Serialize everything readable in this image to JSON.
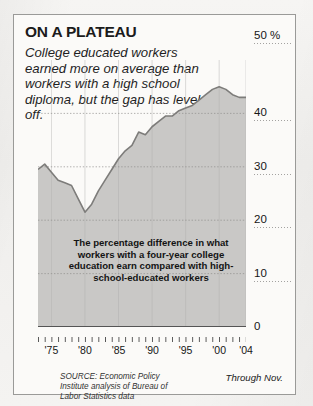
{
  "title": "ON A PLATEAU",
  "subtitle": "College educated workers earned more on average than workers with a high school diploma, but the gap has leveled off.",
  "annotation": "The percentage difference in what workers with a four-year college education earn compared with high-school-educated workers",
  "source": "SOURCE: Economic Policy Institute analysis of Bureau of Labor Statistics data",
  "through_note": "Through Nov.",
  "colors": {
    "area_fill": "#c9c8c6",
    "line": "#7d7c7a",
    "frame": "#9a9a98",
    "text": "#1b1b1b",
    "gridline": "#8d8c8a"
  },
  "chart_data": {
    "type": "area",
    "title": "ON A PLATEAU",
    "subtitle": "College educated workers earned more on average than workers with a high school diploma, but the gap has leveled off.",
    "xlabel": "",
    "ylabel": "",
    "ylim": [
      0,
      50
    ],
    "xlim": [
      1973,
      2004
    ],
    "grid": true,
    "y_unit": "%",
    "y_ticks": [
      0,
      10,
      20,
      30,
      40,
      50
    ],
    "y_tick_labels": [
      "0",
      "10",
      "20",
      "30",
      "40",
      "50 %"
    ],
    "x_ticks": [
      1975,
      1980,
      1985,
      1990,
      1995,
      2000,
      2004
    ],
    "x_tick_labels": [
      "'75",
      "'80",
      "'85",
      "'90",
      "'95",
      "'00",
      "'04"
    ],
    "series": [
      {
        "name": "College wage premium",
        "x": [
          1973,
          1974,
          1975,
          1976,
          1977,
          1978,
          1979,
          1980,
          1981,
          1982,
          1983,
          1984,
          1985,
          1986,
          1987,
          1988,
          1989,
          1990,
          1991,
          1992,
          1993,
          1994,
          1995,
          1996,
          1997,
          1998,
          1999,
          2000,
          2001,
          2002,
          2003,
          2004
        ],
        "values": [
          29.5,
          30.5,
          29.0,
          27.5,
          27.0,
          26.5,
          24.0,
          21.5,
          23.0,
          25.5,
          27.5,
          29.5,
          31.5,
          33.0,
          34.0,
          36.5,
          36.0,
          37.5,
          38.5,
          39.5,
          39.5,
          40.5,
          41.0,
          41.5,
          42.5,
          43.5,
          44.5,
          45.0,
          44.5,
          43.5,
          43.0,
          43.0
        ]
      }
    ]
  }
}
